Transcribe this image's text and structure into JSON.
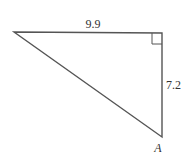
{
  "diagram": {
    "type": "right-triangle",
    "stroke_color": "#555555",
    "vertices": {
      "top_left": [
        14,
        32
      ],
      "right_angle": [
        162,
        33
      ],
      "bottom": [
        162,
        137
      ]
    },
    "labels": {
      "top_side": "9.9",
      "right_side": "7.2",
      "bottom_vertex": "A"
    }
  }
}
